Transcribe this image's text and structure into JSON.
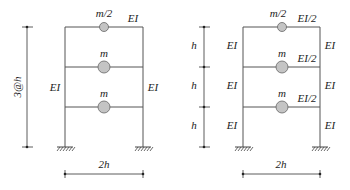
{
  "figure": {
    "left_frame": {
      "mass_labels": [
        "m/2",
        "m",
        "m"
      ],
      "beam_label": "EI",
      "column_left_label": "EI",
      "column_right_label": "EI",
      "height_dimension": "3@h",
      "width_dimension": "2h"
    },
    "right_frame": {
      "mass_labels": [
        "m/2",
        "m",
        "m"
      ],
      "beam_labels": [
        "EI/2",
        "EI/2",
        "EI/2"
      ],
      "column_left_labels": [
        "EI",
        "EI",
        "EI"
      ],
      "column_right_labels": [
        "EI",
        "EI",
        "EI"
      ],
      "story_heights": [
        "h",
        "h",
        "h"
      ],
      "width_dimension": "2h"
    },
    "colors": {
      "mass_fill": "#c4c4c4",
      "line": "#555555"
    }
  }
}
